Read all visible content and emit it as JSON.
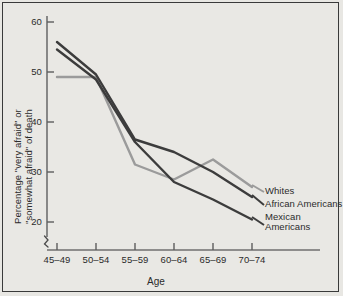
{
  "chart_data": {
    "type": "line",
    "title": "",
    "subtitle": "",
    "xlabel": "Age",
    "ylabel": "Percentage \"very afraid\" or \"somewhat afraid\" of death",
    "ylabel_line1": "Percentage \"very afraid\" or",
    "ylabel_line2": "\"somewhat afraid\" of death",
    "categories": [
      "45–49",
      "50–54",
      "55–59",
      "60–64",
      "65–69",
      "70–74"
    ],
    "xtick_labels": [
      "45–49",
      "50–54",
      "55–59",
      "60–64",
      "65–69",
      "70–74"
    ],
    "ytick_labels": [
      "60",
      "50",
      "40",
      "30",
      "20"
    ],
    "ytick_values": [
      60,
      50,
      40,
      30,
      20
    ],
    "ylim": [
      15,
      62
    ],
    "y_axis_break": true,
    "grid": false,
    "legend_position": "right-inline",
    "series": [
      {
        "name": "Whites",
        "color": "#9b9b9b",
        "values": [
          49,
          49,
          31.5,
          28.5,
          32.5,
          27
        ]
      },
      {
        "name": "African Americans",
        "color": "#3c3c3c",
        "values": [
          56,
          49.5,
          36.5,
          34,
          30,
          25
        ]
      },
      {
        "name": "Mexican Americans",
        "color": "#3c3c3c",
        "values": [
          54.5,
          48.5,
          36,
          28,
          24.5,
          20.5
        ]
      }
    ],
    "legend_entries": [
      {
        "label": "Whites"
      },
      {
        "label": "African Americans"
      },
      {
        "label": "Mexican",
        "label2": "Americans"
      }
    ]
  }
}
